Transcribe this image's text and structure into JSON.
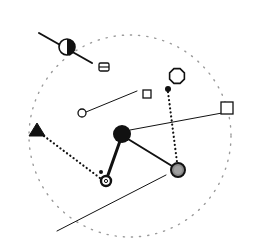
{
  "diagram": {
    "type": "network-diagram",
    "colors": {
      "background": "#ffffff",
      "stroke": "#111111",
      "boundary": "#9a9a9a",
      "gray_fill": "#8a8a8a"
    },
    "boundary": {
      "shape": "dotted-circle",
      "cx": 130,
      "cy": 136,
      "r": 101
    },
    "nodes": [
      {
        "id": "half-filled-circle",
        "shape": "half-filled-circle",
        "x": 67,
        "y": 47,
        "r": 8
      },
      {
        "id": "split-square",
        "shape": "square-with-bar",
        "x": 104,
        "y": 67,
        "size": 10
      },
      {
        "id": "small-open-circle",
        "shape": "open-circle",
        "x": 82,
        "y": 113,
        "r": 4
      },
      {
        "id": "small-square",
        "shape": "open-square",
        "x": 147,
        "y": 94,
        "size": 8
      },
      {
        "id": "octagon",
        "shape": "open-octagon",
        "x": 177,
        "y": 76,
        "r": 8
      },
      {
        "id": "small-dot",
        "shape": "filled-dot",
        "x": 168,
        "y": 89,
        "r": 3
      },
      {
        "id": "large-square",
        "shape": "open-square",
        "x": 227,
        "y": 108,
        "size": 12
      },
      {
        "id": "hub",
        "shape": "filled-circle",
        "x": 122,
        "y": 134,
        "r": 9
      },
      {
        "id": "triangle",
        "shape": "filled-triangle",
        "x": 37,
        "y": 130,
        "size": 14
      },
      {
        "id": "ring-node",
        "shape": "double-ring",
        "x": 106,
        "y": 181,
        "r": 5
      },
      {
        "id": "tiny-dot",
        "shape": "filled-dot",
        "x": 101,
        "y": 172,
        "r": 2
      },
      {
        "id": "gray-node",
        "shape": "gray-ringed-circle",
        "x": 178,
        "y": 170,
        "r": 7
      }
    ],
    "edges": [
      {
        "from": [
          39,
          33
        ],
        "to": [
          92,
          63
        ],
        "style": "solid",
        "width": 2
      },
      {
        "from": [
          86,
          112
        ],
        "to": [
          137,
          91
        ],
        "style": "solid",
        "width": 1
      },
      {
        "from": [
          130,
          130
        ],
        "to": [
          222,
          113
        ],
        "style": "solid",
        "width": 1
      },
      {
        "from": [
          120,
          141
        ],
        "to": [
          108,
          175
        ],
        "style": "solid",
        "width": 3
      },
      {
        "from": [
          128,
          139
        ],
        "to": [
          172,
          166
        ],
        "style": "solid",
        "width": 2
      },
      {
        "from": [
          44,
          136
        ],
        "to": [
          100,
          178
        ],
        "style": "dotted",
        "width": 2
      },
      {
        "from": [
          168,
          92
        ],
        "to": [
          177,
          162
        ],
        "style": "dotted",
        "width": 2
      },
      {
        "from": [
          57,
          231
        ],
        "to": [
          166,
          175
        ],
        "style": "solid",
        "width": 1
      }
    ]
  }
}
